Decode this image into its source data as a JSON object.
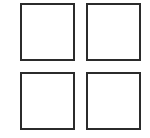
{
  "grid": {
    "rows": 2,
    "cols": 2,
    "border_color": "#2b2b2b",
    "cells": [
      {
        "name": "square-top-left",
        "x": 20,
        "y": 3
      },
      {
        "name": "square-top-right",
        "x": 86,
        "y": 3
      },
      {
        "name": "square-bottom-left",
        "x": 20,
        "y": 72
      },
      {
        "name": "square-bottom-right",
        "x": 86,
        "y": 72
      }
    ]
  }
}
